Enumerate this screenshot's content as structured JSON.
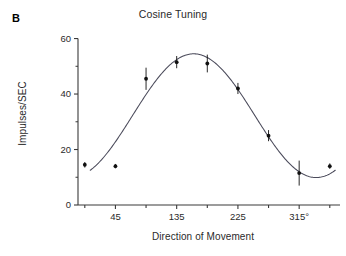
{
  "figure": {
    "panel_label": "B",
    "title": "Cosine Tuning",
    "x_axis_label": "Direction of Movement",
    "y_axis_label": "Impulses/SEC",
    "line_color": "#4a4a5a",
    "marker_color": "#111111",
    "axis_color": "#3a3a3a"
  },
  "chart_data": {
    "type": "scatter",
    "title": "Cosine Tuning",
    "xlabel": "Direction of Movement",
    "ylabel": "Impulses/SEC",
    "xlim": [
      -10,
      375
    ],
    "ylim": [
      0,
      62
    ],
    "grid": false,
    "legend": null,
    "x_ticks": [
      45,
      135,
      225,
      315
    ],
    "x_tick_labels": [
      "45",
      "135",
      "225",
      "315°"
    ],
    "x_minor_ticks": [
      0,
      90,
      180,
      270,
      360
    ],
    "y_ticks": [
      0,
      20,
      40,
      60
    ],
    "y_tick_labels": [
      "0",
      "20",
      "40",
      "60"
    ],
    "y_minor_ticks": [
      10,
      30,
      50
    ],
    "x": [
      0,
      45,
      90,
      135,
      180,
      225,
      270,
      315,
      360
    ],
    "values": [
      14.5,
      14.0,
      45.5,
      51.5,
      51.0,
      42.0,
      25.0,
      11.5,
      14.0
    ],
    "y_err": [
      1.0,
      0.8,
      4.0,
      2.2,
      3.2,
      2.0,
      2.0,
      4.5,
      1.0
    ],
    "fit": {
      "name": "cosine fit",
      "equation": "y = b0 + b1*cos(theta - theta_pref)",
      "baseline": 32.2,
      "amplitude": 22.3,
      "preferred_direction": 160,
      "peak_value": 54.5,
      "min_value": 9.9
    }
  }
}
